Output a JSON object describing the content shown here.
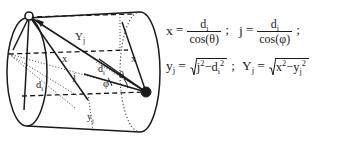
{
  "figure": {
    "type": "geometry-diagram",
    "shape": "cylinder",
    "vertices": [
      {
        "name": "point-p",
        "style": "open-circle",
        "position": "top-left-rim"
      },
      {
        "name": "point-q",
        "style": "filled-circle",
        "position": "right-rim-middle"
      }
    ],
    "labels": {
      "Yj": "Y",
      "Yj_sub": "j",
      "x_upper": "x",
      "x_right": "x",
      "j": "j",
      "di_left": "d",
      "di_left_sub": "i",
      "di_right": "d",
      "di_right_sub": "i",
      "theta": "θ",
      "phi": "φ",
      "yj": "y",
      "yj_sub": "j"
    },
    "colors": {
      "stroke": "#1a1a1a",
      "background": "#ffffff",
      "dotted": "#4a4a4a"
    }
  },
  "equations": {
    "row1": {
      "eq1": {
        "lhs": "x",
        "equals": "=",
        "numerator": "d",
        "numerator_sub": "i",
        "denominator": "cos(θ)",
        "terminator": ";"
      },
      "eq2": {
        "lhs": "j",
        "equals": "=",
        "numerator": "d",
        "numerator_sub": "i",
        "denominator": "cos(φ)",
        "terminator": ";"
      }
    },
    "row2": {
      "eq3": {
        "lhs": "y",
        "lhs_sub": "j",
        "equals": "=",
        "radicand_a": "j",
        "radicand_a_sup": "2",
        "minus": "−",
        "radicand_b": "d",
        "radicand_b_sub": "i",
        "radicand_b_sup": "2",
        "terminator": ";"
      },
      "eq4": {
        "lhs": "Y",
        "lhs_sub": "j",
        "equals": "=",
        "radicand_a": "x",
        "radicand_a_sup": "2",
        "minus": "−",
        "radicand_b": "y",
        "radicand_b_sub": "j",
        "radicand_b_sup": "2"
      }
    }
  }
}
